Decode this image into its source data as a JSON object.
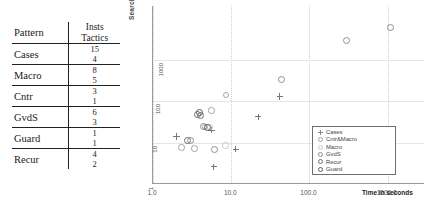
{
  "table": {
    "header": {
      "pattern": "Pattern",
      "insts": "Insts",
      "tactics": "Tactics"
    },
    "rows": [
      {
        "pattern": "Cases",
        "insts": "15",
        "tactics": "4"
      },
      {
        "pattern": "Macro",
        "insts": "8",
        "tactics": "5"
      },
      {
        "pattern": "Cntr",
        "insts": "3",
        "tactics": "1"
      },
      {
        "pattern": "GvdS",
        "insts": "6",
        "tactics": "3"
      },
      {
        "pattern": "Guard",
        "insts": "1",
        "tactics": "1"
      },
      {
        "pattern": "Recur",
        "insts": "4",
        "tactics": "2"
      }
    ]
  },
  "chart_data": {
    "type": "scatter",
    "title": "",
    "xlabel": "Time in seconds",
    "ylabel": "Search Space",
    "xscale": "log",
    "yscale": "log",
    "xlim": [
      1.0,
      3000.0
    ],
    "ylim": [
      1,
      20000
    ],
    "xticks": [
      "1.0",
      "10.0",
      "100.0",
      "1000.0"
    ],
    "xtick_values": [
      1.0,
      10.0,
      100.0,
      1000.0
    ],
    "yticks": [
      "1",
      "10",
      "100",
      "1000"
    ],
    "ytick_values": [
      1,
      10,
      100,
      1000
    ],
    "grid": true,
    "legend_position": "lower right",
    "series": [
      {
        "name": "Cases",
        "marker": "plus",
        "color": "#808080",
        "points": [
          {
            "x": 2.0,
            "y": 14
          },
          {
            "x": 5.6,
            "y": 20
          },
          {
            "x": 6.0,
            "y": 2.6
          },
          {
            "x": 11.5,
            "y": 7.0
          },
          {
            "x": 22.0,
            "y": 42
          },
          {
            "x": 42.0,
            "y": 130
          }
        ]
      },
      {
        "name": "Cntr&Macro",
        "marker": "circle-thin",
        "color": "#9a9a9a",
        "points": [
          {
            "x": 2.3,
            "y": 7.6
          },
          {
            "x": 3.4,
            "y": 7.3
          },
          {
            "x": 4.6,
            "y": 24
          },
          {
            "x": 5.6,
            "y": 60
          },
          {
            "x": 8.6,
            "y": 140
          }
        ]
      },
      {
        "name": "Macro",
        "marker": "circle-light",
        "color": "#bdbdbd",
        "points": [
          {
            "x": 5.3,
            "y": 24
          },
          {
            "x": 8.4,
            "y": 8.6
          }
        ]
      },
      {
        "name": "GvdS",
        "marker": "circle-med",
        "color": "#8a8a8a",
        "points": [
          {
            "x": 3.0,
            "y": 11
          },
          {
            "x": 4.4,
            "y": 24
          },
          {
            "x": 6.2,
            "y": 6.9
          },
          {
            "x": 44.0,
            "y": 340
          },
          {
            "x": 300.0,
            "y": 3000
          },
          {
            "x": 1100.0,
            "y": 6200
          }
        ]
      },
      {
        "name": "Recur",
        "marker": "circle-bold",
        "color": "#6b6b6b",
        "points": [
          {
            "x": 3.7,
            "y": 47
          },
          {
            "x": 4.0,
            "y": 45
          },
          {
            "x": 2.8,
            "y": 11
          }
        ]
      },
      {
        "name": "Guard",
        "marker": "circle-bold2",
        "color": "#5e5e5e",
        "points": [
          {
            "x": 3.9,
            "y": 52
          },
          {
            "x": 5.0,
            "y": 23
          }
        ]
      }
    ]
  }
}
